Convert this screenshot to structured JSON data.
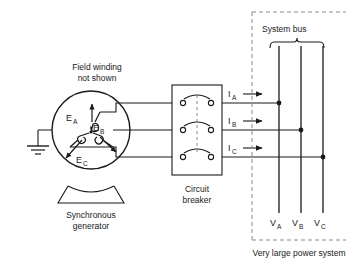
{
  "figure": {
    "type": "single-line-electrical-diagram",
    "background_color": "#ffffff",
    "line_color": "#1a1a1a",
    "text_color": "#1a1a1a"
  },
  "annotations": {
    "field_winding_line1": "Field winding",
    "field_winding_line2": "not shown",
    "generator_label_line1": "Synchronous",
    "generator_label_line2": "generator",
    "breaker_label_line1": "Circuit",
    "breaker_label_line2": "breaker",
    "system_bus_label": "System bus",
    "power_system_caption": "Very large power system"
  },
  "emf_phasors": [
    {
      "base": "E",
      "sub": "A",
      "direction": "up"
    },
    {
      "base": "E",
      "sub": "B",
      "direction": "down-right"
    },
    {
      "base": "E",
      "sub": "C",
      "direction": "down-left"
    }
  ],
  "currents": [
    {
      "base": "I",
      "sub": "A",
      "direction": "right"
    },
    {
      "base": "I",
      "sub": "B",
      "direction": "right"
    },
    {
      "base": "I",
      "sub": "C",
      "direction": "right"
    }
  ],
  "bus_voltages": [
    {
      "base": "V",
      "sub": "A"
    },
    {
      "base": "V",
      "sub": "B"
    },
    {
      "base": "V",
      "sub": "C"
    }
  ],
  "icons": {
    "ground": "ground-symbol",
    "generator": "synchronous-generator-symbol",
    "breaker_pole": "open-switch-contact",
    "bus_brace": "curly-brace"
  }
}
